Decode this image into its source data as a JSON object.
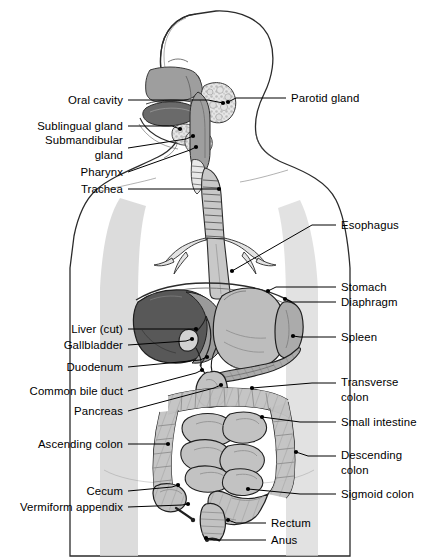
{
  "figure": {
    "width": 445,
    "height": 558,
    "background": "#ffffff"
  },
  "palette": {
    "outline": "#1a1a1a",
    "body_silhouette": "#d6d6d6",
    "liver_dark": "#585858",
    "liver_light": "#9a9a9a",
    "tongue": "#6a6a6a",
    "nasal_palate": "#9e9e9e",
    "stomach": "#bdbdbd",
    "spleen": "#ababab",
    "pancreas": "#a8a8a8",
    "intestine": "#c2c2c2",
    "gland_stipple": "#e2e2e2",
    "trachea": "#c8c8c8",
    "leader_line": "#000000"
  },
  "labels_left": [
    {
      "id": "oral-cavity",
      "text": "Oral cavity",
      "x": 123,
      "y": 100,
      "lines": 1
    },
    {
      "id": "sublingual-gland",
      "text": "Sublingual gland",
      "x": 123,
      "y": 126,
      "lines": 1
    },
    {
      "id": "submandibular-gland",
      "text": "Submandibular\ngland",
      "x": 123,
      "y": 148,
      "lines": 2
    },
    {
      "id": "pharynx",
      "text": "Pharynx",
      "x": 123,
      "y": 172,
      "lines": 1
    },
    {
      "id": "trachea",
      "text": "Trachea",
      "x": 123,
      "y": 189,
      "lines": 1
    },
    {
      "id": "liver-cut",
      "text": "Liver (cut)",
      "x": 123,
      "y": 329,
      "lines": 1
    },
    {
      "id": "gallbladder",
      "text": "Gallbladder",
      "x": 123,
      "y": 345,
      "lines": 1
    },
    {
      "id": "duodenum",
      "text": "Duodenum",
      "x": 123,
      "y": 367,
      "lines": 1
    },
    {
      "id": "common-bile-duct",
      "text": "Common bile duct",
      "x": 123,
      "y": 391,
      "lines": 1
    },
    {
      "id": "pancreas",
      "text": "Pancreas",
      "x": 123,
      "y": 411,
      "lines": 1
    },
    {
      "id": "ascending-colon",
      "text": "Ascending colon",
      "x": 123,
      "y": 444,
      "lines": 1
    },
    {
      "id": "cecum",
      "text": "Cecum",
      "x": 123,
      "y": 491,
      "lines": 1
    },
    {
      "id": "vermiform-appendix",
      "text": "Vermiform appendix",
      "x": 123,
      "y": 507,
      "lines": 1
    }
  ],
  "labels_right": [
    {
      "id": "parotid-gland",
      "text": "Parotid gland",
      "x": 291,
      "y": 98,
      "lines": 1
    },
    {
      "id": "esophagus",
      "text": "Esophagus",
      "x": 341,
      "y": 225,
      "lines": 1
    },
    {
      "id": "stomach",
      "text": "Stomach",
      "x": 341,
      "y": 287,
      "lines": 1
    },
    {
      "id": "diaphragm",
      "text": "Diaphragm",
      "x": 341,
      "y": 302,
      "lines": 1
    },
    {
      "id": "spleen",
      "text": "Spleen",
      "x": 341,
      "y": 337,
      "lines": 1
    },
    {
      "id": "transverse-colon",
      "text": "Transverse\ncolon",
      "x": 341,
      "y": 390,
      "lines": 2
    },
    {
      "id": "small-intestine",
      "text": "Small intestine",
      "x": 341,
      "y": 422,
      "lines": 1
    },
    {
      "id": "descending-colon",
      "text": "Descending\ncolon",
      "x": 341,
      "y": 463,
      "lines": 2
    },
    {
      "id": "sigmoid-colon",
      "text": "Sigmoid colon",
      "x": 341,
      "y": 494,
      "lines": 1
    },
    {
      "id": "rectum",
      "text": "Rectum",
      "x": 271,
      "y": 523,
      "lines": 1
    },
    {
      "id": "anus",
      "text": "Anus",
      "x": 271,
      "y": 540,
      "lines": 1
    }
  ],
  "leaders_left": [
    {
      "id": "oral-cavity",
      "pts": "128,100 208,100 223,103"
    },
    {
      "id": "sublingual-gland",
      "pts": "128,126 172,126 180,129"
    },
    {
      "id": "submandibular-gland",
      "pts": "128,148 186,139 193,136"
    },
    {
      "id": "pharynx",
      "pts": "128,172 190,150 196,147"
    },
    {
      "id": "trachea",
      "pts": "128,189 212,189 219,189"
    },
    {
      "id": "liver-cut",
      "pts": "128,329 190,329 196,329"
    },
    {
      "id": "gallbladder",
      "pts": "128,345 186,341 192,339"
    },
    {
      "id": "duodenum",
      "pts": "128,367 200,360 207,357"
    },
    {
      "id": "common-bile-duct",
      "pts": "128,391 196,373 202,370"
    },
    {
      "id": "pancreas",
      "pts": "128,411 214,388 221,385"
    },
    {
      "id": "ascending-colon",
      "pts": "128,444 162,444 168,444"
    },
    {
      "id": "cecum",
      "pts": "128,491 172,487 178,485"
    },
    {
      "id": "vermiform-appendix",
      "pts": "128,507 182,505 188,504"
    }
  ],
  "leaders_right": [
    {
      "id": "parotid-gland",
      "pts": "286,98 236,98 228,102"
    },
    {
      "id": "esophagus",
      "pts": "336,225 312,225 232,271"
    },
    {
      "id": "stomach",
      "pts": "336,287 276,287 268,291"
    },
    {
      "id": "diaphragm",
      "pts": "336,302 292,302 285,299"
    },
    {
      "id": "spleen",
      "pts": "336,337 300,337 293,336"
    },
    {
      "id": "transverse-colon",
      "pts": "336,383 312,383 252,388"
    },
    {
      "id": "small-intestine",
      "pts": "336,422 300,422 262,417"
    },
    {
      "id": "descending-colon",
      "pts": "336,456 308,456 296,452"
    },
    {
      "id": "sigmoid-colon",
      "pts": "336,494 300,494 248,489"
    },
    {
      "id": "rectum",
      "pts": "266,523 236,523 228,520"
    },
    {
      "id": "anus",
      "pts": "266,540 214,540 206,538"
    }
  ],
  "structures": [
    {
      "id": "head-profile",
      "name": "head profile outline"
    },
    {
      "id": "nasal-palate",
      "name": "nasal cavity and hard palate"
    },
    {
      "id": "tongue",
      "name": "tongue"
    },
    {
      "id": "parotid-gland-art",
      "name": "parotid gland"
    },
    {
      "id": "sublingual-gland-art",
      "name": "sublingual gland"
    },
    {
      "id": "submandibular-gland-art",
      "name": "submandibular gland"
    },
    {
      "id": "pharynx-art",
      "name": "pharynx"
    },
    {
      "id": "trachea-art",
      "name": "trachea with cartilage rings"
    },
    {
      "id": "bronchi-art",
      "name": "bronchial tree"
    },
    {
      "id": "esophagus-art",
      "name": "esophagus"
    },
    {
      "id": "diaphragm-art",
      "name": "diaphragm"
    },
    {
      "id": "liver-art",
      "name": "liver, cut"
    },
    {
      "id": "gallbladder-art",
      "name": "gallbladder"
    },
    {
      "id": "bile-duct-art",
      "name": "common bile duct"
    },
    {
      "id": "stomach-art",
      "name": "stomach"
    },
    {
      "id": "spleen-art",
      "name": "spleen"
    },
    {
      "id": "pancreas-art",
      "name": "pancreas"
    },
    {
      "id": "duodenum-art",
      "name": "duodenum"
    },
    {
      "id": "transverse-colon-art",
      "name": "transverse colon"
    },
    {
      "id": "ascending-colon-art",
      "name": "ascending colon"
    },
    {
      "id": "descending-colon-art",
      "name": "descending colon"
    },
    {
      "id": "small-intestine-art",
      "name": "small intestine"
    },
    {
      "id": "cecum-art",
      "name": "cecum"
    },
    {
      "id": "appendix-art",
      "name": "vermiform appendix"
    },
    {
      "id": "sigmoid-colon-art",
      "name": "sigmoid colon"
    },
    {
      "id": "rectum-art",
      "name": "rectum"
    },
    {
      "id": "anus-art",
      "name": "anus"
    }
  ]
}
